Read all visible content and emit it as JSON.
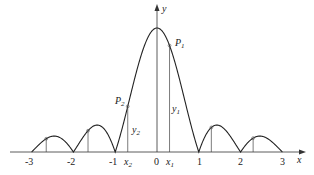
{
  "figure": {
    "type": "function-graph",
    "axes": {
      "x_label": "x",
      "y_label": "y",
      "x_ticks": [
        "-3",
        "-2",
        "-1",
        "0",
        "1",
        "2",
        "3"
      ],
      "x_tick_values": [
        -3,
        -2,
        -1,
        0,
        1,
        2,
        3
      ]
    },
    "points": [
      {
        "name": "P",
        "sub": "1",
        "x_name": "x",
        "x_sub": "1",
        "y_name": "y",
        "y_sub": "1",
        "x": 0.3
      },
      {
        "name": "P",
        "sub": "2",
        "x_name": "x",
        "x_sub": "2",
        "y_name": "y",
        "y_sub": "2",
        "x": -0.7
      }
    ],
    "side_markers_x": [
      -2.65,
      -1.65,
      1.3,
      2.3
    ],
    "colors": {
      "curve": "#222222",
      "axis": "#333333",
      "background": "#ffffff"
    }
  }
}
